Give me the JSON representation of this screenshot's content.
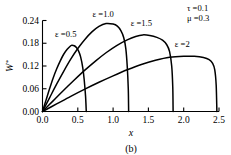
{
  "figure": {
    "caption": "(b)",
    "background": "#ffffff",
    "line_color": "#000000"
  },
  "annotations": {
    "tau": "τ =0.1",
    "mu": "μ =0.3"
  },
  "axis": {
    "x_title": "x",
    "y_title_main": "W",
    "y_title_sup": "*",
    "x_ticklabels": [
      "0.0",
      "0.5",
      "1.0",
      "1.5",
      "2.0",
      "2.5"
    ],
    "y_ticklabels": [
      "0.00",
      "0.06",
      "0.12",
      "0.18",
      "0.24"
    ]
  },
  "chart_data": {
    "type": "line",
    "title": "",
    "subtitle": "(b)",
    "xlabel": "x",
    "ylabel": "W*",
    "xlim": [
      0.0,
      2.5
    ],
    "ylim": [
      0.0,
      0.24
    ],
    "xticks": [
      0.0,
      0.5,
      1.0,
      1.5,
      2.0,
      2.5
    ],
    "yticks": [
      0.0,
      0.06,
      0.12,
      0.18,
      0.24
    ],
    "grid": false,
    "legend": "inline-curve-labels",
    "annotations": [
      "τ =0.1",
      "μ =0.3"
    ],
    "series": [
      {
        "name": "ε =0.5",
        "label": "ε =0.5",
        "label_x": 0.33,
        "label_y": 0.196,
        "peak_x": 0.42,
        "peak_y": 0.175,
        "cutoff_x": 0.62,
        "points": [
          [
            0.0,
            0.0
          ],
          [
            0.05,
            0.03
          ],
          [
            0.1,
            0.06
          ],
          [
            0.15,
            0.088
          ],
          [
            0.2,
            0.112
          ],
          [
            0.25,
            0.133
          ],
          [
            0.3,
            0.151
          ],
          [
            0.35,
            0.164
          ],
          [
            0.4,
            0.1735
          ],
          [
            0.42,
            0.175
          ],
          [
            0.45,
            0.1735
          ],
          [
            0.48,
            0.169
          ],
          [
            0.51,
            0.16
          ],
          [
            0.54,
            0.144
          ],
          [
            0.57,
            0.116
          ],
          [
            0.59,
            0.085
          ],
          [
            0.61,
            0.04
          ],
          [
            0.62,
            0.0
          ]
        ]
      },
      {
        "name": "ε =1.0",
        "label": "ε =1.0",
        "label_x": 0.86,
        "label_y": 0.248,
        "peak_x": 0.9,
        "peak_y": 0.232,
        "cutoff_x": 1.22,
        "points": [
          [
            0.0,
            0.0
          ],
          [
            0.1,
            0.036
          ],
          [
            0.2,
            0.072
          ],
          [
            0.3,
            0.106
          ],
          [
            0.4,
            0.138
          ],
          [
            0.5,
            0.166
          ],
          [
            0.6,
            0.19
          ],
          [
            0.7,
            0.21
          ],
          [
            0.8,
            0.2245
          ],
          [
            0.9,
            0.232
          ],
          [
            1.0,
            0.2305
          ],
          [
            1.06,
            0.225
          ],
          [
            1.11,
            0.213
          ],
          [
            1.15,
            0.195
          ],
          [
            1.18,
            0.166
          ],
          [
            1.2,
            0.12
          ],
          [
            1.215,
            0.06
          ],
          [
            1.22,
            0.0
          ]
        ]
      },
      {
        "name": "ε =1.5",
        "label": "ε =1.5",
        "label_x": 1.4,
        "label_y": 0.226,
        "peak_x": 1.42,
        "peak_y": 0.202,
        "cutoff_x": 1.85,
        "points": [
          [
            0.0,
            0.0
          ],
          [
            0.15,
            0.028
          ],
          [
            0.3,
            0.056
          ],
          [
            0.45,
            0.083
          ],
          [
            0.6,
            0.109
          ],
          [
            0.75,
            0.133
          ],
          [
            0.9,
            0.155
          ],
          [
            1.05,
            0.174
          ],
          [
            1.2,
            0.189
          ],
          [
            1.32,
            0.198
          ],
          [
            1.42,
            0.202
          ],
          [
            1.52,
            0.2005
          ],
          [
            1.62,
            0.1955
          ],
          [
            1.7,
            0.188
          ],
          [
            1.76,
            0.176
          ],
          [
            1.8,
            0.158
          ],
          [
            1.83,
            0.12
          ],
          [
            1.845,
            0.065
          ],
          [
            1.85,
            0.0
          ]
        ]
      },
      {
        "name": "ε =2",
        "label": "ε =2",
        "label_x": 1.98,
        "label_y": 0.171,
        "peak_x": 2.02,
        "peak_y": 0.146,
        "cutoff_x": 2.47,
        "points": [
          [
            0.0,
            0.0
          ],
          [
            0.2,
            0.02
          ],
          [
            0.4,
            0.04
          ],
          [
            0.6,
            0.059
          ],
          [
            0.8,
            0.077
          ],
          [
            1.0,
            0.094
          ],
          [
            1.2,
            0.11
          ],
          [
            1.4,
            0.124
          ],
          [
            1.6,
            0.135
          ],
          [
            1.8,
            0.143
          ],
          [
            2.0,
            0.1458
          ],
          [
            2.15,
            0.1455
          ],
          [
            2.28,
            0.1425
          ],
          [
            2.36,
            0.137
          ],
          [
            2.41,
            0.127
          ],
          [
            2.44,
            0.11
          ],
          [
            2.46,
            0.07
          ],
          [
            2.47,
            0.0
          ]
        ]
      }
    ]
  }
}
